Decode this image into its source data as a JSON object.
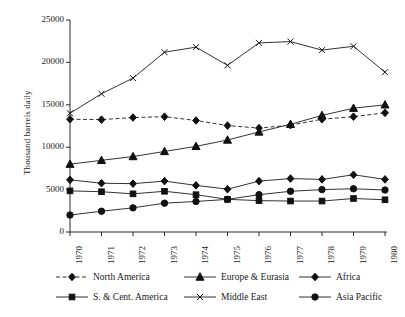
{
  "chart_data": {
    "type": "line",
    "title": "",
    "xlabel": "",
    "ylabel": "Thousand barrels daily",
    "x": [
      1970,
      1971,
      1972,
      1973,
      1974,
      1975,
      1976,
      1977,
      1978,
      1979,
      1980
    ],
    "xtick_labels": [
      "1970",
      "1971",
      "1972",
      "1973",
      "1974",
      "1975",
      "1976",
      "1977",
      "1978",
      "1979",
      "1980"
    ],
    "ytick_labels": [
      "0",
      "5000",
      "10000",
      "15000",
      "20000",
      "25000"
    ],
    "yticks": [
      0,
      5000,
      10000,
      15000,
      20000,
      25000
    ],
    "ylim": [
      0,
      25000
    ],
    "xlim": [
      1970,
      1980
    ],
    "grid": false,
    "legend_position": "bottom",
    "series": [
      {
        "name": "North America",
        "marker": "diamond",
        "linestyle": "dashed",
        "color": "#333333",
        "values": [
          13300,
          13250,
          13500,
          13600,
          13150,
          12550,
          12250,
          12600,
          13300,
          13600,
          14050
        ]
      },
      {
        "name": "Europe & Eurasia",
        "marker": "triangle",
        "linestyle": "solid",
        "color": "#333333",
        "values": [
          8000,
          8450,
          8900,
          9500,
          10100,
          10850,
          11800,
          12700,
          13750,
          14600,
          15000
        ]
      },
      {
        "name": "Africa",
        "marker": "diamond",
        "linestyle": "solid",
        "color": "#333333",
        "values": [
          6150,
          5750,
          5700,
          6000,
          5500,
          5050,
          6000,
          6300,
          6200,
          6750,
          6200
        ]
      },
      {
        "name": "S. & Cent. America",
        "marker": "square",
        "linestyle": "solid",
        "color": "#333333",
        "values": [
          4850,
          4750,
          4500,
          4800,
          4400,
          3850,
          3700,
          3650,
          3650,
          3950,
          3800
        ]
      },
      {
        "name": "Middle East",
        "marker": "x",
        "linestyle": "solid",
        "color": "#333333",
        "values": [
          14000,
          16300,
          18150,
          21200,
          21800,
          19650,
          22300,
          22450,
          21450,
          21900,
          18850
        ]
      },
      {
        "name": "Asia Pacific",
        "marker": "circle",
        "linestyle": "solid",
        "color": "#333333",
        "values": [
          2000,
          2450,
          2850,
          3400,
          3600,
          3850,
          4400,
          4800,
          5000,
          5100,
          4950
        ]
      }
    ]
  },
  "legend": {
    "rows": [
      [
        {
          "label": "North America",
          "marker": "diamond",
          "linestyle": "dashed"
        },
        {
          "label": "Europe & Eurasia",
          "marker": "triangle",
          "linestyle": "solid"
        },
        {
          "label": "Africa",
          "marker": "diamond",
          "linestyle": "solid"
        }
      ],
      [
        {
          "label": "S. & Cent. America",
          "marker": "square",
          "linestyle": "solid"
        },
        {
          "label": "Middle East",
          "marker": "x",
          "linestyle": "solid"
        },
        {
          "label": "Asia Pacific",
          "marker": "circle",
          "linestyle": "solid"
        }
      ]
    ]
  },
  "colors": {
    "axis": "#2b2b2b",
    "series": "#333333",
    "marker": "#111111",
    "background": "#ffffff"
  }
}
